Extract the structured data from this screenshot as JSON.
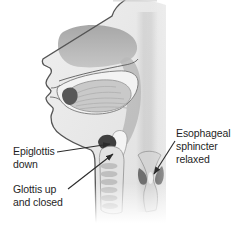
{
  "figure": {
    "background": "#ffffff",
    "palette": {
      "outline": "#555555",
      "skin": "#e9e9e9",
      "cavity_gray": "#b3b3b3",
      "tongue_gray": "#c9c9c9",
      "dark_structure": "#3f3f3f",
      "sphincter_dark": "#6f6f6f",
      "ring_gray": "#bfbfbf",
      "leader_color": "#2b2b2b",
      "label_color": "#1f1f1f"
    },
    "annotations": [
      {
        "id": "epiglottis-down",
        "lines": [
          "Epiglottis",
          "down"
        ]
      },
      {
        "id": "glottis-up-and-closed",
        "lines": [
          "Glottis up",
          "and closed"
        ]
      },
      {
        "id": "esophageal-sphincter-relaxed",
        "lines": [
          "Esophageal",
          "sphincter",
          "relaxed"
        ]
      }
    ],
    "structures": [
      "head-profile",
      "nasal-cavity",
      "pharynx",
      "palate",
      "tongue",
      "epiglottis",
      "glottis-vestibule",
      "trachea",
      "tracheal-rings",
      "esophagus",
      "esophageal-sphincter"
    ]
  }
}
